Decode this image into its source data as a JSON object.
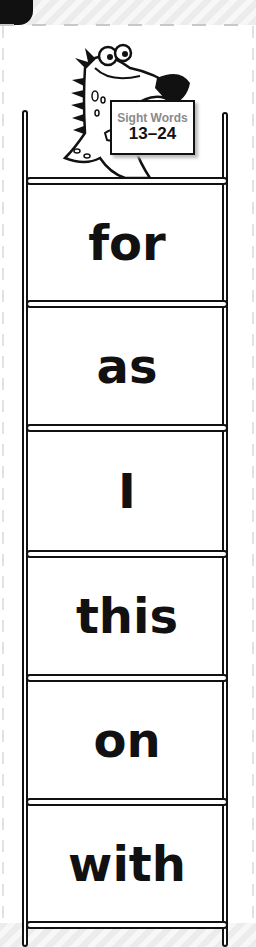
{
  "header": {
    "corner_tab_color": "#111111"
  },
  "mascot": {
    "name": "dinosaur-mascot",
    "sign": {
      "title": "Sight Words",
      "range": "13–24"
    }
  },
  "ladder": {
    "rail_color": "#111111",
    "words": [
      {
        "label": "for"
      },
      {
        "label": "as"
      },
      {
        "label": "I"
      },
      {
        "label": "this"
      },
      {
        "label": "on"
      },
      {
        "label": "with"
      }
    ]
  }
}
